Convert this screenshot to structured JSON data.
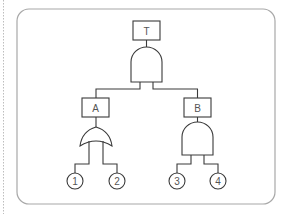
{
  "diagram": {
    "type": "fault-tree",
    "top_event": {
      "label": "T",
      "gate": "AND"
    },
    "intermediate_events": [
      {
        "id": "A",
        "label": "A",
        "gate": "OR",
        "inputs": [
          "1",
          "2"
        ]
      },
      {
        "id": "B",
        "label": "B",
        "gate": "AND",
        "inputs": [
          "3",
          "4"
        ]
      }
    ],
    "basic_events": [
      {
        "label": "1"
      },
      {
        "label": "2"
      },
      {
        "label": "3"
      },
      {
        "label": "4"
      }
    ],
    "colors": {
      "line": "#3a3a3a",
      "frame": "#a8a8a8",
      "text": "#555555",
      "background": "#ffffff"
    }
  }
}
